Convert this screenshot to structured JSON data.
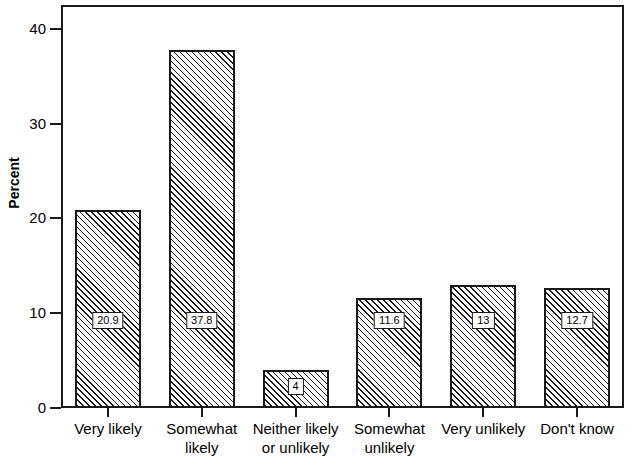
{
  "chart_data": {
    "type": "bar",
    "title": "",
    "xlabel": "",
    "ylabel": "Percent",
    "ylim": [
      0,
      42.5
    ],
    "grid": false,
    "legend": null,
    "categories": [
      "Very likely",
      "Somewhat likely",
      "Neither likely or unlikely",
      "Somewhat unlikely",
      "Very unlikely",
      "Don't know"
    ],
    "category_lines": [
      [
        "Very likely"
      ],
      [
        "Somewhat",
        "likely"
      ],
      [
        "Neither likely",
        "or unlikely"
      ],
      [
        "Somewhat",
        "unlikely"
      ],
      [
        "Very unlikely"
      ],
      [
        "Don't know"
      ]
    ],
    "values": [
      20.9,
      37.8,
      4,
      11.6,
      13,
      12.7
    ],
    "value_labels": [
      "20.9",
      "37.8",
      "4",
      "11.6",
      "13",
      "12.7"
    ],
    "yticks": [
      0,
      10,
      20,
      30,
      40
    ],
    "ytick_labels": [
      "0",
      "10",
      "20",
      "30",
      "40"
    ]
  },
  "axes": {
    "y_title": "Percent"
  },
  "style": {
    "bar_fill": "#ffffff",
    "bar_hatch_color": "#1a1a1a",
    "frame_color": "#1a1a1a",
    "background": "#ffffff"
  }
}
